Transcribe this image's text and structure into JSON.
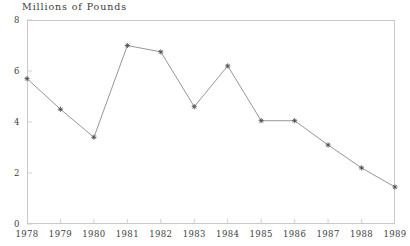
{
  "chart_data": {
    "type": "line",
    "title": "Millions of Pounds",
    "xlabel": "",
    "ylabel": "",
    "categories": [
      "1978",
      "1979",
      "1980",
      "1981",
      "1982",
      "1983",
      "1984",
      "1985",
      "1986",
      "1987",
      "1988",
      "1989"
    ],
    "values": [
      5.7,
      4.5,
      3.4,
      7.0,
      6.75,
      4.6,
      6.2,
      4.05,
      4.05,
      3.1,
      2.2,
      1.45
    ],
    "series": [
      {
        "name": "Millions of Pounds",
        "values": [
          5.7,
          4.5,
          3.4,
          7.0,
          6.75,
          4.6,
          6.2,
          4.05,
          4.05,
          3.1,
          2.2,
          1.45
        ]
      }
    ],
    "ylim": [
      0,
      8
    ],
    "yticks": [
      0,
      2,
      4,
      6,
      8
    ],
    "ytick_labels": [
      "0",
      "2",
      "4",
      "6",
      "8"
    ],
    "xtick_labels": [
      "1978",
      "1979",
      "1980",
      "1981",
      "1982",
      "1983",
      "1984",
      "1985",
      "1986",
      "1987",
      "1988",
      "1989"
    ],
    "grid": false,
    "legend": "none",
    "marker": "star",
    "line_color": "#8a8a8a",
    "marker_color": "#4a4a4a",
    "axis_color": "#c9c9c9",
    "text_color": "#3d3d3d"
  }
}
